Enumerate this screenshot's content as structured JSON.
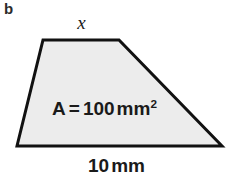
{
  "figure": {
    "part_label": "b",
    "shape": {
      "name": "trapezoid",
      "fill_color": "#ececec",
      "stroke_color": "#111111",
      "stroke_width": 3,
      "vertices": [
        {
          "x": 43,
          "y": 40
        },
        {
          "x": 119,
          "y": 40
        },
        {
          "x": 222,
          "y": 146
        },
        {
          "x": 17,
          "y": 146
        }
      ],
      "points_attr": "43,40 119,40 222,146 17,146"
    },
    "labels": {
      "top_side": "x",
      "area_symbol": "A",
      "area_equals": "=",
      "area_value": "100",
      "area_unit": "mm",
      "area_unit_exponent": "2",
      "bottom_side_value": "10",
      "bottom_side_unit": "mm"
    }
  }
}
